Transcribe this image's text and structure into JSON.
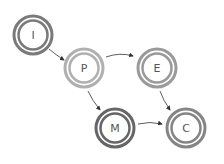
{
  "diagram": {
    "type": "state-flow",
    "nodes": [
      {
        "id": "I",
        "label": "I",
        "cx": 33,
        "cy": 35,
        "color": "#7a7a7a"
      },
      {
        "id": "P",
        "label": "P",
        "cx": 84,
        "cy": 68,
        "color": "#b0b0b0"
      },
      {
        "id": "E",
        "label": "E",
        "cx": 157,
        "cy": 68,
        "color": "#9a9a9a"
      },
      {
        "id": "M",
        "label": "M",
        "cx": 115,
        "cy": 128,
        "color": "#666666"
      },
      {
        "id": "C",
        "label": "C",
        "cx": 186,
        "cy": 128,
        "color": "#858585"
      }
    ],
    "edges": [
      {
        "from": "I",
        "to": "P"
      },
      {
        "from": "P",
        "to": "E"
      },
      {
        "from": "P",
        "to": "M"
      },
      {
        "from": "E",
        "to": "C"
      },
      {
        "from": "M",
        "to": "C"
      }
    ]
  }
}
